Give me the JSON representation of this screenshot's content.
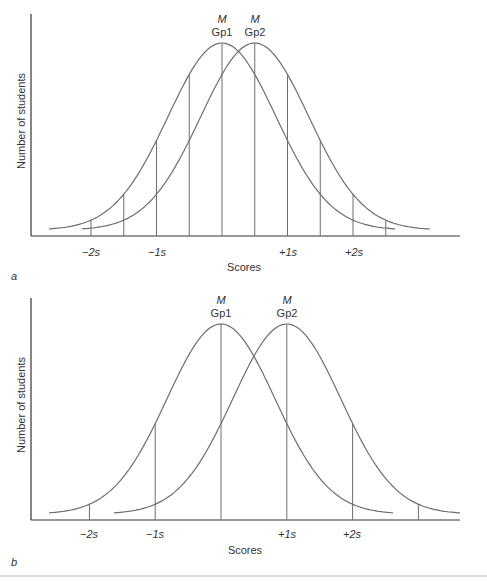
{
  "chart_data": [
    {
      "panel_label": "a",
      "type": "line",
      "title": "",
      "xlabel": "Scores",
      "ylabel": "Number of students",
      "x_ticks": [
        "−2s",
        "−1s",
        "+1s",
        "+2s"
      ],
      "x_tick_values": [
        -2,
        -1,
        1,
        2
      ],
      "grid": false,
      "series": [
        {
          "name": "Gp1",
          "mean_label": "M",
          "distribution": "normal",
          "mean": 0.0,
          "sd": 1.0
        },
        {
          "name": "Gp2",
          "mean_label": "M",
          "distribution": "normal",
          "mean": 0.5,
          "sd": 1.0
        }
      ],
      "vertical_lines_sd_units": [
        -2,
        -1.5,
        -1,
        -0.5,
        0,
        0.5,
        1,
        1.5,
        2,
        2.5
      ],
      "mean_difference_sd": 0.5
    },
    {
      "panel_label": "b",
      "type": "line",
      "title": "",
      "xlabel": "Scores",
      "ylabel": "Number of students",
      "x_ticks": [
        "−2s",
        "−1s",
        "+1s",
        "+2s"
      ],
      "x_tick_values": [
        -2,
        -1,
        1,
        2
      ],
      "grid": false,
      "series": [
        {
          "name": "Gp1",
          "mean_label": "M",
          "distribution": "normal",
          "mean": 0.0,
          "sd": 1.0
        },
        {
          "name": "Gp2",
          "mean_label": "M",
          "distribution": "normal",
          "mean": 1.0,
          "sd": 1.0
        }
      ],
      "vertical_lines_sd_units": [
        -2,
        -1,
        0,
        1,
        2,
        3
      ],
      "mean_difference_sd": 1.0
    }
  ],
  "panels": {
    "a": {
      "label": "a",
      "ylabel": "Number of students",
      "xlabel": "Scores",
      "gp1_top": "M",
      "gp1_bottom": "Gp1",
      "gp2_top": "M",
      "gp2_bottom": "Gp2",
      "ticks": [
        "−2s",
        "−1s",
        "+1s",
        "+2s"
      ]
    },
    "b": {
      "label": "b",
      "ylabel": "Number of students",
      "xlabel": "Scores",
      "gp1_top": "M",
      "gp1_bottom": "Gp1",
      "gp2_top": "M",
      "gp2_bottom": "Gp2",
      "ticks": [
        "−2s",
        "−1s",
        "+1s",
        "+2s"
      ]
    }
  },
  "colors": {
    "line": "#6e6e6e",
    "axis": "#333333",
    "text": "#333333",
    "rule": "#bdbdbd"
  }
}
